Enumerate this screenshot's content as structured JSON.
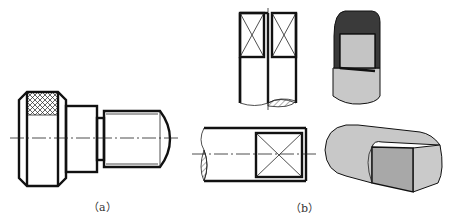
{
  "figure": {
    "type": "engineering drawing",
    "subfigures": [
      {
        "id": "a",
        "label": "(a)",
        "description": "Knurled stepped shaft with threaded end, front view"
      },
      {
        "id": "b",
        "label": "(b)",
        "description": "Shaft ends with flat (square) milled faces, orthographic and isometric views"
      }
    ]
  },
  "labels": {
    "a": "（a）",
    "b": "（b）"
  },
  "colors": {
    "line": "#111111",
    "dark_face": "#3a3a3a",
    "mid_face": "#bdbdbd",
    "light_face": "#d0d0d0",
    "cylinder": "#c8c8c8"
  }
}
